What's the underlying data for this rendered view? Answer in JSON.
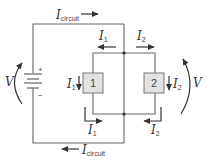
{
  "diagram": {
    "type": "parallel circuit",
    "source": {
      "label": "V",
      "plus": "+",
      "minus": "−"
    },
    "load_voltage_label": "V",
    "components": [
      {
        "id": "1",
        "label": "1",
        "fill": "#e2e2e2"
      },
      {
        "id": "2",
        "label": "2",
        "fill": "#e2e2e2"
      }
    ],
    "currents": {
      "circuit_top": {
        "main": "I",
        "sub": "circuit"
      },
      "circuit_bottom": {
        "main": "I",
        "sub": "circuit"
      },
      "branch1_top": {
        "main": "I",
        "sub": "1"
      },
      "branch2_top": {
        "main": "I",
        "sub": "2"
      },
      "branch1_side": {
        "main": "I",
        "sub": "1"
      },
      "branch2_side": {
        "main": "I",
        "sub": "2"
      },
      "branch1_bottom": {
        "main": "I",
        "sub": "1"
      },
      "branch2_bottom": {
        "main": "I",
        "sub": "2"
      }
    },
    "colors": {
      "wire": "#666666",
      "component_fill": "#e2e2e2",
      "component_border": "#777777",
      "text": "#333333"
    }
  }
}
